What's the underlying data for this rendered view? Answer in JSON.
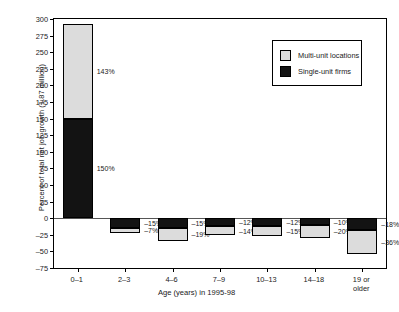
{
  "chart_data": {
    "type": "bar",
    "subtype": "stacked-bar",
    "title": "",
    "xlabel": "Age (years) in 1995-98",
    "ylabel": "Percent of total net job growth (1.87 million)",
    "categories": [
      "0–1",
      "2–3",
      "4–6",
      "7–9",
      "10–13",
      "14–18",
      "19 or\nolder"
    ],
    "ylim": [
      -75,
      300
    ],
    "yticks": [
      300,
      275,
      250,
      225,
      200,
      175,
      150,
      125,
      100,
      75,
      50,
      25,
      0,
      -25,
      -50,
      -75
    ],
    "ytick_labels": [
      "300",
      "275",
      "250",
      "225",
      "200",
      "175",
      "150",
      "125",
      "100",
      "75",
      "50",
      "25",
      "0",
      "–25",
      "–50",
      "–75"
    ],
    "grid": false,
    "legend_position": "upper-right",
    "series": [
      {
        "name": "Single-unit firms",
        "color": "#131313",
        "values": [
          150,
          -15,
          -15,
          -12,
          -12,
          -10,
          -18
        ],
        "labels": [
          "150%",
          "–15%",
          "–15%",
          "–12%",
          "–12%",
          "–10%",
          "–18%"
        ]
      },
      {
        "name": "Multi-unit locations",
        "color": "#dcdcdc",
        "values": [
          143,
          -7,
          -19,
          -14,
          -15,
          -20,
          -36
        ],
        "labels": [
          "143%",
          "–7%",
          "–19%",
          "–14%",
          "–15%",
          "–20%",
          "–36%"
        ]
      }
    ],
    "legend": [
      {
        "label": "Multi-unit locations",
        "color": "#dcdcdc"
      },
      {
        "label": "Single-unit firms",
        "color": "#131313"
      }
    ]
  }
}
